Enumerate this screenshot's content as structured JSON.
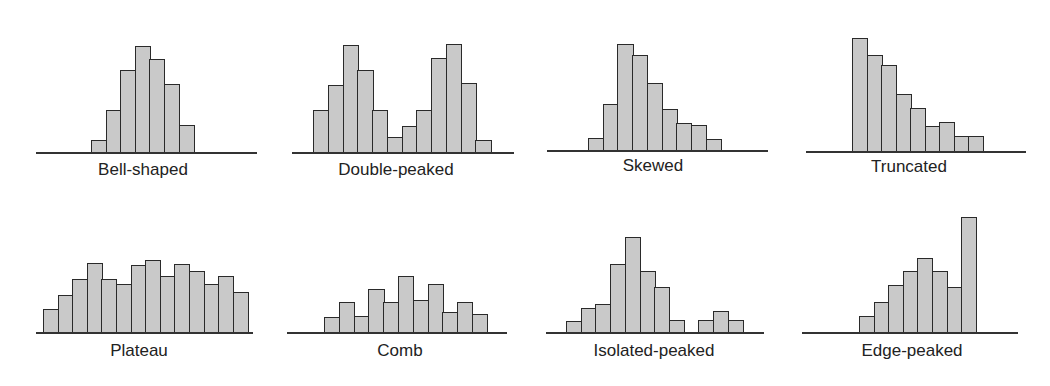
{
  "chart_data": [
    {
      "type": "bar",
      "title": "Bell-shaped",
      "baseline": {
        "x1": 36,
        "x2": 257,
        "y": 152
      },
      "bars": {
        "x0": 91,
        "width": 14.6
      },
      "values": [
        12,
        42,
        82,
        106,
        93,
        68,
        27
      ],
      "label": {
        "cx": 143,
        "y": 160
      }
    },
    {
      "type": "bar",
      "title": "Double-peaked",
      "baseline": {
        "x1": 292,
        "x2": 514,
        "y": 152
      },
      "bars": {
        "x0": 313,
        "width": 14.75
      },
      "values": [
        42,
        67,
        107,
        82,
        42,
        15,
        26,
        42,
        94,
        108,
        69,
        12
      ],
      "label": {
        "cx": 396,
        "y": 160
      }
    },
    {
      "type": "bar",
      "title": "Skewed",
      "baseline": {
        "x1": 547,
        "x2": 768,
        "y": 150
      },
      "bars": {
        "x0": 588,
        "width": 14.7
      },
      "values": [
        12,
        46,
        106,
        95,
        67,
        41,
        27,
        25,
        11
      ],
      "label": {
        "cx": 653,
        "y": 156
      }
    },
    {
      "type": "bar",
      "title": "Truncated",
      "baseline": {
        "x1": 806,
        "x2": 1026,
        "y": 151
      },
      "bars": {
        "x0": 852,
        "width": 14.5
      },
      "values": [
        113,
        96,
        86,
        57,
        43,
        25,
        29,
        15,
        15
      ],
      "label": {
        "cx": 909,
        "y": 157
      }
    },
    {
      "type": "bar",
      "title": "Plateau",
      "baseline": {
        "x1": 36,
        "x2": 253,
        "y": 332
      },
      "bars": {
        "x0": 43,
        "width": 14.6
      },
      "values": [
        23,
        37,
        53,
        69,
        53,
        48,
        67,
        72,
        56,
        68,
        61,
        48,
        56,
        40
      ],
      "label": {
        "cx": 139,
        "y": 341
      }
    },
    {
      "type": "bar",
      "title": "Comb",
      "baseline": {
        "x1": 287,
        "x2": 507,
        "y": 332
      },
      "bars": {
        "x0": 324,
        "width": 14.8
      },
      "values": [
        15,
        30,
        16,
        43,
        30,
        56,
        32,
        48,
        20,
        30,
        18
      ],
      "label": {
        "cx": 400,
        "y": 341
      }
    },
    {
      "type": "bar",
      "title": "Isolated-peaked",
      "baseline": {
        "x1": 546,
        "x2": 764,
        "y": 332
      },
      "bars": {
        "x0": 566,
        "width": 14.7
      },
      "values": [
        11,
        24,
        28,
        68,
        95,
        61,
        45,
        12,
        0,
        12,
        21,
        12
      ],
      "label": {
        "cx": 654,
        "y": 341
      }
    },
    {
      "type": "bar",
      "title": "Edge-peaked",
      "baseline": {
        "x1": 802,
        "x2": 1018,
        "y": 332
      },
      "bars": {
        "x0": 859,
        "width": 14.6
      },
      "values": [
        16,
        30,
        47,
        61,
        74,
        61,
        45,
        115
      ],
      "label": {
        "cx": 912,
        "y": 341
      }
    }
  ],
  "colors": {
    "bar_fill": "#c9c9c9",
    "bar_border": "#2a2a2a",
    "axis": "#333333",
    "text": "#222222"
  }
}
